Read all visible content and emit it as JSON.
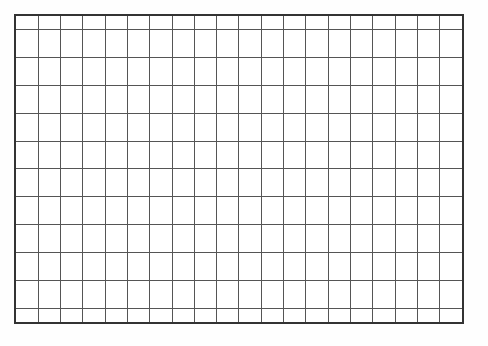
{
  "figure": {
    "name": "blank-grid",
    "background_color": "#fefefe",
    "cell_fill_color": "#ffffff",
    "line_color": "#555555",
    "outer_border_color": "#333333",
    "line_width_px": 1,
    "outer_border_width_px": 2,
    "columns": 20,
    "rows": 12,
    "left_px": 14,
    "top_px": 14,
    "width_px": 450,
    "height_px": 310,
    "cell_width_px": 22.5,
    "cell_height_px": 25.83
  },
  "chart_data": {
    "type": "table",
    "title": "",
    "xlabel": "",
    "ylabel": "",
    "grid": true,
    "legend": "none",
    "columns": 20,
    "rows": 12,
    "column_headers": [],
    "row_headers": [],
    "cells": [
      [
        "",
        "",
        "",
        "",
        "",
        "",
        "",
        "",
        "",
        "",
        "",
        "",
        "",
        "",
        "",
        "",
        "",
        "",
        "",
        ""
      ],
      [
        "",
        "",
        "",
        "",
        "",
        "",
        "",
        "",
        "",
        "",
        "",
        "",
        "",
        "",
        "",
        "",
        "",
        "",
        "",
        ""
      ],
      [
        "",
        "",
        "",
        "",
        "",
        "",
        "",
        "",
        "",
        "",
        "",
        "",
        "",
        "",
        "",
        "",
        "",
        "",
        "",
        ""
      ],
      [
        "",
        "",
        "",
        "",
        "",
        "",
        "",
        "",
        "",
        "",
        "",
        "",
        "",
        "",
        "",
        "",
        "",
        "",
        "",
        ""
      ],
      [
        "",
        "",
        "",
        "",
        "",
        "",
        "",
        "",
        "",
        "",
        "",
        "",
        "",
        "",
        "",
        "",
        "",
        "",
        "",
        ""
      ],
      [
        "",
        "",
        "",
        "",
        "",
        "",
        "",
        "",
        "",
        "",
        "",
        "",
        "",
        "",
        "",
        "",
        "",
        "",
        "",
        ""
      ],
      [
        "",
        "",
        "",
        "",
        "",
        "",
        "",
        "",
        "",
        "",
        "",
        "",
        "",
        "",
        "",
        "",
        "",
        "",
        "",
        ""
      ],
      [
        "",
        "",
        "",
        "",
        "",
        "",
        "",
        "",
        "",
        "",
        "",
        "",
        "",
        "",
        "",
        "",
        "",
        "",
        "",
        ""
      ],
      [
        "",
        "",
        "",
        "",
        "",
        "",
        "",
        "",
        "",
        "",
        "",
        "",
        "",
        "",
        "",
        "",
        "",
        "",
        "",
        ""
      ],
      [
        "",
        "",
        "",
        "",
        "",
        "",
        "",
        "",
        "",
        "",
        "",
        "",
        "",
        "",
        "",
        "",
        "",
        "",
        "",
        ""
      ],
      [
        "",
        "",
        "",
        "",
        "",
        "",
        "",
        "",
        "",
        "",
        "",
        "",
        "",
        "",
        "",
        "",
        "",
        "",
        "",
        ""
      ],
      [
        "",
        "",
        "",
        "",
        "",
        "",
        "",
        "",
        "",
        "",
        "",
        "",
        "",
        "",
        "",
        "",
        "",
        "",
        "",
        ""
      ]
    ]
  }
}
